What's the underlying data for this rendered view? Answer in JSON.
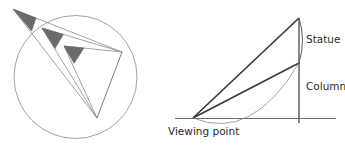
{
  "figure": {
    "background_color": "#ffffff",
    "line_color": "#8a8a8a",
    "bold_line_color": "#3a3a3a",
    "wedge_color": "#6b6b6b",
    "text_color": "#2b2b2b"
  },
  "left_diagram": {
    "name": "inscribed-angle-circle",
    "circle": {
      "cx": 75.5,
      "cy": 77,
      "r": 61.5
    },
    "chord_endpoints": [
      {
        "id": "right-point",
        "x": 122,
        "y": 52
      },
      {
        "id": "bottom-point",
        "x": 97,
        "y": 118
      }
    ],
    "angle_vertices": [
      {
        "id": "exterior-vertex",
        "x": 13,
        "y": 9,
        "position": "outside-circle",
        "wedge_radius": 25
      },
      {
        "id": "on-circle-vertex",
        "x": 42,
        "y": 28,
        "position": "on-circle",
        "wedge_radius": 22
      },
      {
        "id": "interior-vertex",
        "x": 64,
        "y": 46,
        "position": "inside-circle",
        "wedge_radius": 20
      }
    ]
  },
  "right_diagram": {
    "name": "statue-column-viewing-angle",
    "ground_line": {
      "x1": 175,
      "y1": 118.5,
      "x2": 336,
      "y2": 118.5
    },
    "viewing_point": {
      "x": 193,
      "y": 118
    },
    "pole": {
      "x": 299,
      "y_top": 18,
      "y_bottom": 123
    },
    "statue_segment": {
      "x": 299,
      "y_top": 18,
      "y_bottom": 63
    },
    "column_segment": {
      "x": 299,
      "y_top": 63,
      "y_bottom": 118
    },
    "arc": {
      "start_x": 193,
      "start_y": 118,
      "end_x": 299,
      "end_y": 63,
      "sag": 18
    },
    "labels": {
      "statue": "Statue",
      "column": "Column",
      "viewing_point": "Viewing point"
    },
    "label_positions": {
      "statue": {
        "x": 306,
        "y": 40
      },
      "column": {
        "x": 306,
        "y": 87
      },
      "viewing_point": {
        "x": 168,
        "y": 132
      }
    }
  }
}
